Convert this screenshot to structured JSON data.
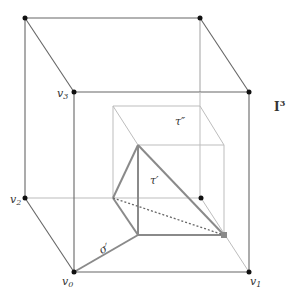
{
  "diagram": {
    "title_label": "I",
    "title_sup": "3",
    "colors": {
      "outer_edge": "#555555",
      "inner_edge": "#b8b8b8",
      "triangle_edge": "#888888",
      "dot": "#111111",
      "dotted": "#666666"
    },
    "vertex_labels": {
      "v0": "v",
      "v0_sub": "0",
      "v1": "v",
      "v1_sub": "1",
      "v2": "v",
      "v2_sub": "2",
      "v3": "v",
      "v3_sub": "3"
    },
    "simplex_labels": {
      "sigma_prime": "σ′",
      "tau_prime": "τ′",
      "tau_double_prime": "τ″"
    }
  }
}
